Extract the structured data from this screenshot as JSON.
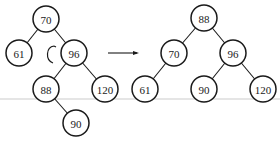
{
  "diagram": {
    "before": {
      "nodes": [
        {
          "id": "b70",
          "label": "70"
        },
        {
          "id": "b61",
          "label": "61"
        },
        {
          "id": "b96",
          "label": "96"
        },
        {
          "id": "b88",
          "label": "88"
        },
        {
          "id": "b120",
          "label": "120"
        },
        {
          "id": "b90",
          "label": "90"
        }
      ],
      "edges": [
        [
          "b70",
          "b61"
        ],
        [
          "b70",
          "b96"
        ],
        [
          "b96",
          "b88"
        ],
        [
          "b96",
          "b120"
        ],
        [
          "b88",
          "b90"
        ]
      ],
      "rotation_indicator": "counterclockwise-arc"
    },
    "transition": "right-arrow",
    "after": {
      "nodes": [
        {
          "id": "a88",
          "label": "88"
        },
        {
          "id": "a70",
          "label": "70"
        },
        {
          "id": "a96",
          "label": "96"
        },
        {
          "id": "a61",
          "label": "61"
        },
        {
          "id": "a90",
          "label": "90"
        },
        {
          "id": "a120",
          "label": "120"
        }
      ],
      "edges": [
        [
          "a88",
          "a70"
        ],
        [
          "a88",
          "a96"
        ],
        [
          "a70",
          "a61"
        ],
        [
          "a96",
          "a90"
        ],
        [
          "a96",
          "a120"
        ]
      ]
    }
  }
}
